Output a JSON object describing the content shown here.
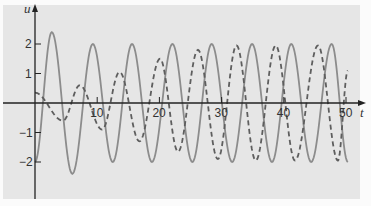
{
  "chart_data": {
    "type": "line",
    "title": "",
    "xlabel": "t",
    "ylabel": "u",
    "xlim": [
      0,
      52
    ],
    "ylim": [
      -2.9,
      3.1
    ],
    "grid": false,
    "legend": null,
    "x_ticks": [
      10,
      20,
      30,
      40,
      50
    ],
    "x_tick_labels": [
      "10",
      "20",
      "30",
      "40",
      "50"
    ],
    "y_ticks": [
      2,
      1,
      -1,
      -2
    ],
    "y_tick_labels": [
      "2",
      "1",
      "−1",
      "−2"
    ],
    "series": [
      {
        "name": "solid",
        "style": "solid",
        "color": "#8c8c8c",
        "x": [
          0,
          2.7,
          6.0,
          9.3,
          12.5,
          15.6,
          18.8,
          22.1,
          25.3,
          28.4,
          31.7,
          34.9,
          38.1,
          41.2,
          44.4,
          47.7,
          50.3
        ],
        "values": [
          -2.0,
          2.4,
          -2.4,
          2.0,
          -2.0,
          2.0,
          -2.0,
          2.0,
          -2.0,
          2.0,
          -2.0,
          2.0,
          -2.0,
          2.0,
          -2.0,
          2.0,
          -2.0
        ]
      },
      {
        "name": "dashed",
        "style": "dashed",
        "color": "#666666",
        "x": [
          0,
          4.5,
          7.2,
          10.8,
          13.6,
          16.8,
          20.1,
          23.0,
          26.2,
          29.4,
          32.4,
          35.5,
          38.7,
          41.8,
          45.5,
          48.7,
          50.3
        ],
        "values": [
          0.35,
          -0.6,
          0.6,
          -0.9,
          1.05,
          -1.3,
          1.5,
          -1.65,
          1.8,
          -1.9,
          1.95,
          -1.95,
          1.95,
          -1.95,
          1.95,
          -1.95,
          1.1
        ]
      }
    ]
  },
  "axes": {
    "x_label": "t",
    "y_label": "u",
    "x_tick_labels": [
      "10",
      "20",
      "30",
      "40",
      "50"
    ],
    "y_tick_labels": [
      "2",
      "1",
      "−1",
      "−2"
    ]
  },
  "colors": {
    "panel": "#e6e6e6",
    "axis": "#222222",
    "solid": "#8c8c8c",
    "dashed": "#5e5e5e"
  }
}
